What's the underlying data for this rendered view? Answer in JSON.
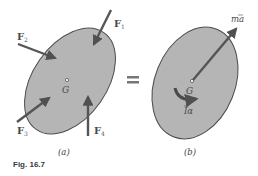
{
  "figure": {
    "caption": "Fig. 16.7",
    "equals_sign": "="
  },
  "panel_a": {
    "label": "(a)",
    "center_label": "G",
    "forces": [
      {
        "name": "F",
        "sub": "1"
      },
      {
        "name": "F",
        "sub": "2"
      },
      {
        "name": "F",
        "sub": "3"
      },
      {
        "name": "F",
        "sub": "4"
      }
    ]
  },
  "panel_b": {
    "label": "(b)",
    "center_label": "G",
    "linear_effect": {
      "prefix": "m",
      "symbol": "a",
      "overbar": true
    },
    "angular_effect": {
      "symbol": "I",
      "suffix": "α",
      "overbar": true
    }
  },
  "colors": {
    "body_fill": "#b5b5b5",
    "body_stroke": "#4a4a4a",
    "arrow": "#555555",
    "text": "#4a4a4a"
  }
}
